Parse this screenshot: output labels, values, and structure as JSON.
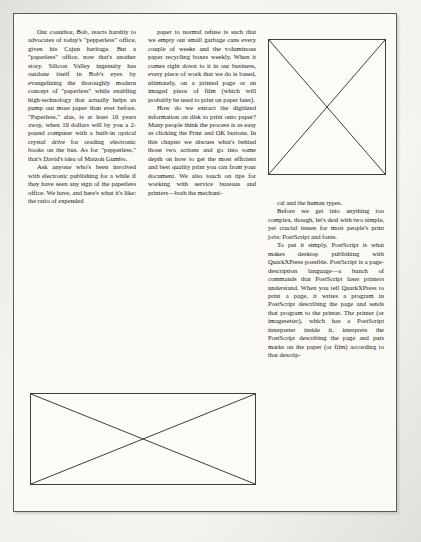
{
  "document": {
    "kind": "scanned-book-page",
    "page_background_color": "#f4f3ef",
    "paper_color": "#fbfaf7",
    "ink_color": "#16150f",
    "border_color": "#5b5b58"
  },
  "columns": [
    {
      "id": "column-1",
      "paragraphs": [
        "Our coauthor, Bob, reacts harshly to advocates of today's \"pepperless\" office, given his Cajun heritage. But a \"paperless\" office, now that's another story. Silicon Valley ingenuity has outdone itself in Bob's eyes by evangelizing the thoroughly modern concept of \"paperless\" while enabling high-technology that actually helps us pump out more paper than ever before. \"Paperless,\" alas, is at least 10 years away, when 10 dollars will by you a 2-pound computer with a built-in optical crystal drive for reading electronic books on the bus. As for \"pepperless,\" that's David's idea of Matzoh Gumbo.",
        "Ask anyone who's been involved with electronic publishing for a while if they have seen any sign of the paperless office. We have, and here's what it's like: the ratio of expended"
      ]
    },
    {
      "id": "column-2",
      "paragraphs": [
        "paper to normal refuse is such that we empty our small garbage cans every couple of weeks and the voluminous paper recycling boxes weekly. When it comes right down to it in our business, every piece of work that we do is based, ultimately, on a printed page or an imaged piece of film (which will probably be used to print on paper later).",
        "How do we extract the digitized information on disk to print onto paper? Many people think the process is as easy as clicking the Print and OK buttons. In this chapter we discuss what's behind those two actions and go into some depth on how to get the most efficient and best quality print you can from your document. We also touch on tips for working with service bureaus and printers—both the mechani-"
      ]
    },
    {
      "id": "column-3",
      "paragraphs": [
        "cal and the human types.",
        "Before we get into anything too complex, though, let's deal with two simple, yet crucial issues for most people's print jobs: PostScript and fonts.",
        "To put it simply, PostScript is what makes desktop publishing with QuarkXPress possible. PostScript is a page-description language—a bunch of commands that PostScript laser printers understand. When you tell QuarkXPress to print a page, it writes a program in PostScript describing the page and sends that program to the printer. The printer (or imagesetter), which has a PostScript interpreter inside it, interprets the PostScript describing the page and puts marks on the paper (or film) according to that descrip-"
      ]
    }
  ],
  "figures": [
    {
      "id": "figure-top-right",
      "label": "image-placeholder",
      "shape": "rectangle-with-x",
      "column": "column-3",
      "position": "top"
    },
    {
      "id": "figure-bottom-wide",
      "label": "image-placeholder",
      "shape": "rectangle-with-x",
      "column": "column-1-and-2",
      "position": "bottom"
    }
  ]
}
